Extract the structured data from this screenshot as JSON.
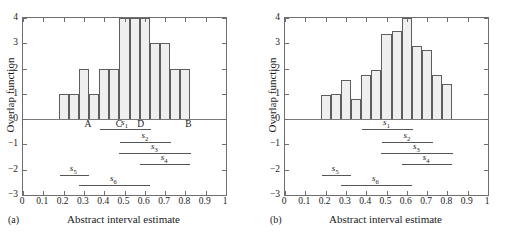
{
  "figure": {
    "panels": [
      {
        "letter": "(a)",
        "y_axis_label": "Overlap function",
        "x_axis_label": "Abstract interval estimate"
      },
      {
        "letter": "(b)",
        "y_axis_label": "Overlap function",
        "x_axis_label": "Abstract interval estimate"
      }
    ],
    "xticklabels": [
      "0",
      "0.1",
      "0.2",
      "0.3",
      "0.4",
      "0.5",
      "0.6",
      "0.7",
      "0.8",
      "0.9",
      "1"
    ],
    "yticklabels": [
      "4",
      "3",
      "2",
      "1",
      "0",
      "−1",
      "−2",
      "−3"
    ],
    "markers": [
      "A",
      "C",
      "D",
      "B"
    ],
    "segment_labels": [
      "s",
      "s",
      "s",
      "s",
      "s",
      "s"
    ],
    "segment_subs": [
      "1",
      "2",
      "3",
      "4",
      "5",
      "6"
    ]
  },
  "chart_data": [
    {
      "type": "bar",
      "title": "(a)",
      "xlabel": "Abstract interval estimate",
      "ylabel": "Overlap function",
      "xlim": [
        0,
        1
      ],
      "ylim": [
        -3,
        4
      ],
      "xticks": [
        0,
        0.1,
        0.2,
        0.3,
        0.4,
        0.5,
        0.6,
        0.7,
        0.8,
        0.9,
        1
      ],
      "yticks": [
        -3,
        -2,
        -1,
        0,
        1,
        2,
        3,
        4
      ],
      "grid": false,
      "legend": "none",
      "bar_width": 0.05,
      "bin_left_edges": [
        0.175,
        0.225,
        0.275,
        0.325,
        0.375,
        0.425,
        0.475,
        0.525,
        0.575,
        0.625,
        0.675,
        0.725,
        0.775
      ],
      "values": [
        1,
        1,
        2,
        1,
        2,
        2,
        4,
        4,
        4,
        3,
        3,
        2,
        2
      ],
      "markers": [
        {
          "label": "A",
          "x": 0.325
        },
        {
          "label": "C",
          "x": 0.478
        },
        {
          "label": "D",
          "x": 0.585
        },
        {
          "label": "B",
          "x": 0.82
        }
      ],
      "segments": [
        {
          "name": "s1",
          "label": "s",
          "sub": "1",
          "x0": 0.38,
          "x1": 0.63,
          "y": -0.38
        },
        {
          "name": "s2",
          "label": "s",
          "sub": "2",
          "x0": 0.48,
          "x1": 0.73,
          "y": -0.9
        },
        {
          "name": "s3",
          "label": "s",
          "sub": "3",
          "x0": 0.475,
          "x1": 0.83,
          "y": -1.35
        },
        {
          "name": "s4",
          "label": "s",
          "sub": "4",
          "x0": 0.575,
          "x1": 0.825,
          "y": -1.78
        },
        {
          "name": "s5",
          "label": "s",
          "sub": "5",
          "x0": 0.18,
          "x1": 0.325,
          "y": -2.2
        },
        {
          "name": "s6",
          "label": "s",
          "sub": "6",
          "x0": 0.275,
          "x1": 0.625,
          "y": -2.62
        }
      ]
    },
    {
      "type": "bar",
      "title": "(b)",
      "xlabel": "Abstract interval estimate",
      "ylabel": "Overlap function",
      "xlim": [
        0,
        1
      ],
      "ylim": [
        -3,
        4
      ],
      "xticks": [
        0,
        0.1,
        0.2,
        0.3,
        0.4,
        0.5,
        0.6,
        0.7,
        0.8,
        0.9,
        1
      ],
      "yticks": [
        -3,
        -2,
        -1,
        0,
        1,
        2,
        3,
        4
      ],
      "grid": false,
      "legend": "none",
      "bar_width": 0.05,
      "bin_left_edges": [
        0.175,
        0.225,
        0.275,
        0.325,
        0.375,
        0.425,
        0.475,
        0.525,
        0.575,
        0.625,
        0.675,
        0.725,
        0.775
      ],
      "values": [
        0.95,
        1.0,
        1.55,
        0.8,
        1.75,
        1.95,
        3.35,
        3.48,
        4.0,
        2.88,
        2.75,
        1.73,
        1.4
      ],
      "markers": [],
      "segments": [
        {
          "name": "s1",
          "label": "s",
          "sub": "1",
          "x0": 0.38,
          "x1": 0.63,
          "y": -0.38
        },
        {
          "name": "s2",
          "label": "s",
          "sub": "2",
          "x0": 0.48,
          "x1": 0.73,
          "y": -0.9
        },
        {
          "name": "s3",
          "label": "s",
          "sub": "3",
          "x0": 0.475,
          "x1": 0.83,
          "y": -1.35
        },
        {
          "name": "s4",
          "label": "s",
          "sub": "4",
          "x0": 0.575,
          "x1": 0.825,
          "y": -1.78
        },
        {
          "name": "s5",
          "label": "s",
          "sub": "5",
          "x0": 0.18,
          "x1": 0.325,
          "y": -2.2
        },
        {
          "name": "s6",
          "label": "s",
          "sub": "6",
          "x0": 0.275,
          "x1": 0.625,
          "y": -2.62
        }
      ]
    }
  ]
}
